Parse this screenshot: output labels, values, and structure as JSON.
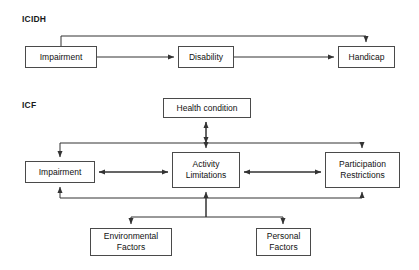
{
  "diagram": {
    "sections": [
      {
        "id": "icidh",
        "label": "ICIDH"
      },
      {
        "id": "icf",
        "label": "ICF"
      }
    ],
    "icidh_nodes": [
      {
        "id": "impairment",
        "label": "Impairment",
        "x": 25,
        "y": 46,
        "w": 72,
        "h": 22
      },
      {
        "id": "disability",
        "label": "Disability",
        "x": 178,
        "y": 46,
        "w": 56,
        "h": 22
      },
      {
        "id": "handicap",
        "label": "Handicap",
        "x": 338,
        "y": 46,
        "w": 57,
        "h": 22
      }
    ],
    "icf_nodes": [
      {
        "id": "health-condition",
        "label": "Health condition",
        "x": 163,
        "y": 98,
        "w": 88,
        "h": 20
      },
      {
        "id": "impairment",
        "label": "Impairment",
        "x": 25,
        "y": 161,
        "w": 70,
        "h": 22
      },
      {
        "id": "activity-limitations",
        "label": "Activity Limitations",
        "x": 172,
        "y": 152,
        "w": 68,
        "h": 36
      },
      {
        "id": "participation-restrictions",
        "label": "Participation Restrictions",
        "x": 325,
        "y": 152,
        "w": 75,
        "h": 36
      },
      {
        "id": "environmental-factors",
        "label": "Environmental Factors",
        "x": 90,
        "y": 228,
        "w": 82,
        "h": 28
      },
      {
        "id": "personal-factors",
        "label": "Personal Factors",
        "x": 256,
        "y": 228,
        "w": 55,
        "h": 28
      }
    ],
    "colors": {
      "box_border": "#4a4a4a",
      "connector": "#333333",
      "background": "#ffffff",
      "text": "#111111"
    }
  }
}
